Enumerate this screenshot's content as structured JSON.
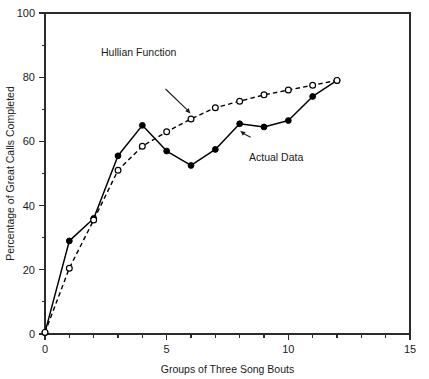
{
  "chart_data": {
    "type": "line",
    "title": "",
    "xlabel": "Groups of Three Song Bouts",
    "ylabel": "Percentage of Great Calls Completed",
    "xlim": [
      0,
      15
    ],
    "ylim": [
      0,
      100
    ],
    "xticks": [
      0,
      5,
      10,
      15
    ],
    "xtick_labels": [
      "0",
      "5",
      "10",
      "15"
    ],
    "x_minor_step": 1,
    "yticks": [
      0,
      20,
      40,
      60,
      80,
      100
    ],
    "ytick_labels": [
      "0",
      "20",
      "40",
      "60",
      "80",
      "100"
    ],
    "y_minor_step": 10,
    "grid": false,
    "legend_position": "inline-annotations",
    "x": [
      0,
      1,
      2,
      3,
      4,
      5,
      6,
      7,
      8,
      9,
      10,
      11,
      12
    ],
    "series": [
      {
        "name": "Actual Data",
        "marker": "filled-circle",
        "line_style": "solid",
        "color": "#000000",
        "values": [
          0.5,
          29,
          36,
          55.5,
          65,
          57,
          52.5,
          57.5,
          65.5,
          64.5,
          66.5,
          74,
          79
        ]
      },
      {
        "name": "Hullian Function",
        "marker": "open-circle",
        "line_style": "dashed",
        "color": "#000000",
        "values": [
          0.5,
          20.5,
          35.5,
          51,
          58.5,
          63,
          67,
          70.5,
          72.5,
          74.5,
          76,
          77.5,
          79
        ]
      }
    ],
    "annotations": [
      {
        "text": "Hullian Function",
        "label_x": 3.85,
        "label_y": 86.5,
        "arrow_to_x": 6.0,
        "arrow_to_y": 68.5
      },
      {
        "text": "Actual Data",
        "label_x": 9.5,
        "label_y": 54.0,
        "arrow_to_x": 8.0,
        "arrow_to_y": 63.5
      }
    ]
  },
  "axis_labels": {
    "x_title": "Groups of Three Song Bouts",
    "y_title": "Percentage of Great Calls Completed"
  }
}
